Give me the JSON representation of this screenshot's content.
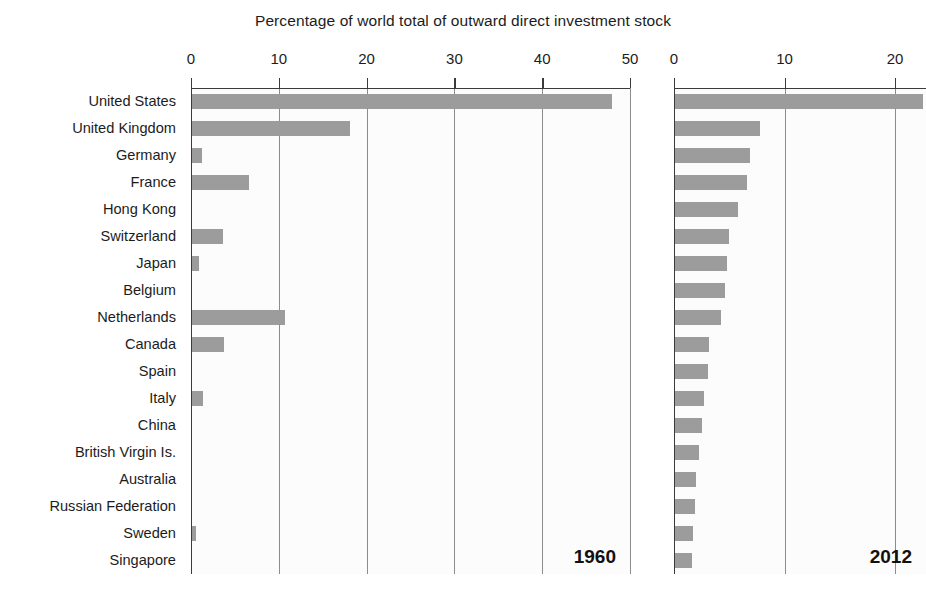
{
  "chart_data": {
    "type": "bar",
    "orientation": "horizontal",
    "title": "Percentage of world total of outward direct investment stock",
    "xlabel": "",
    "ylabel": "",
    "grid": true,
    "legend": false,
    "categories": [
      "United States",
      "United Kingdom",
      "Germany",
      "France",
      "Hong Kong",
      "Switzerland",
      "Japan",
      "Belgium",
      "Netherlands",
      "Canada",
      "Spain",
      "Italy",
      "China",
      "British Virgin Is.",
      "Australia",
      "Russian Federation",
      "Sweden",
      "Singapore"
    ],
    "panels": [
      {
        "name": "1960",
        "annotation": "1960",
        "xlim": [
          0,
          50
        ],
        "xticks": [
          0,
          10,
          20,
          30,
          40,
          50
        ],
        "xticklabels": [
          "0",
          "10",
          "20",
          "30",
          "40",
          "50"
        ],
        "values": [
          47.8,
          18.0,
          1.1,
          6.5,
          0.0,
          3.5,
          0.8,
          0.0,
          10.6,
          3.6,
          0.0,
          1.3,
          0.0,
          0.0,
          0.0,
          0.0,
          0.5,
          0.0
        ]
      },
      {
        "name": "2012",
        "annotation": "2012",
        "xlim": [
          0,
          22.8
        ],
        "xticks": [
          0,
          10,
          20
        ],
        "xticklabels": [
          "0",
          "10",
          "20"
        ],
        "values": [
          22.4,
          7.7,
          6.8,
          6.5,
          5.7,
          4.9,
          4.7,
          4.5,
          4.2,
          3.1,
          3.0,
          2.6,
          2.4,
          2.2,
          1.9,
          1.8,
          1.6,
          1.5
        ]
      }
    ],
    "colors": {
      "bar": "#9c9c9c",
      "grid": "#8c8c8c",
      "axis": "#3a3a3a",
      "panel_background": "#fcfcfc",
      "text": "#1c1c1c"
    }
  }
}
